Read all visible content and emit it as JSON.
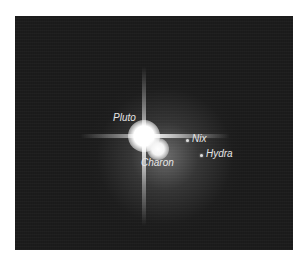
{
  "image": {
    "subject": "Pluto system telescope image",
    "background_color": "#1c1c1c",
    "label_color": "#e6e6e6"
  },
  "labels": {
    "pluto": "Pluto",
    "charon": "Charon",
    "nix": "Nix",
    "hydra": "Hydra"
  }
}
